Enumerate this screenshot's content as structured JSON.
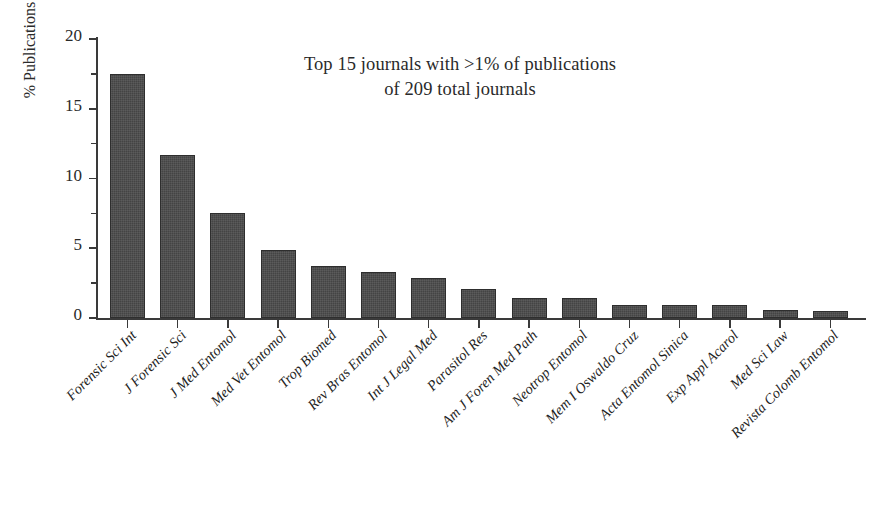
{
  "chart_data": {
    "type": "bar",
    "title": "Top 15 journals with >1% of publications of 209 total journals",
    "title_lines": [
      "Top 15 journals with >1% of publications",
      "of 209 total journals"
    ],
    "xlabel": "",
    "ylabel": "% Publications",
    "ylim": [
      0,
      20
    ],
    "ytick_labels": [
      "0",
      "5",
      "10",
      "15",
      "20"
    ],
    "ytick_values": [
      0,
      5,
      10,
      15,
      20
    ],
    "yminor_values": [
      2.5,
      7.5,
      12.5,
      17.5
    ],
    "grid": false,
    "legend": false,
    "bar_color": "#4b4b4b",
    "categories": [
      "Forensic Sci Int",
      "J Forensic Sci",
      "J Med Entomol",
      "Med Vet Entomol",
      "Trop Biomed",
      "Rev Bras Entomol",
      "Int J Legal Med",
      "Parasitol Res",
      "Am J Foren Med Path",
      "Neotrop Entomol",
      "Mem I Oswaldo Cruz",
      "Acta Entomol Sinica",
      "Exp Appl Acarol",
      "Med Sci Law",
      "Revista Colomb Entomol"
    ],
    "values": [
      17.5,
      11.7,
      7.5,
      4.9,
      3.7,
      3.3,
      2.85,
      2.1,
      1.4,
      1.4,
      0.95,
      0.95,
      0.9,
      0.6,
      0.5
    ]
  }
}
